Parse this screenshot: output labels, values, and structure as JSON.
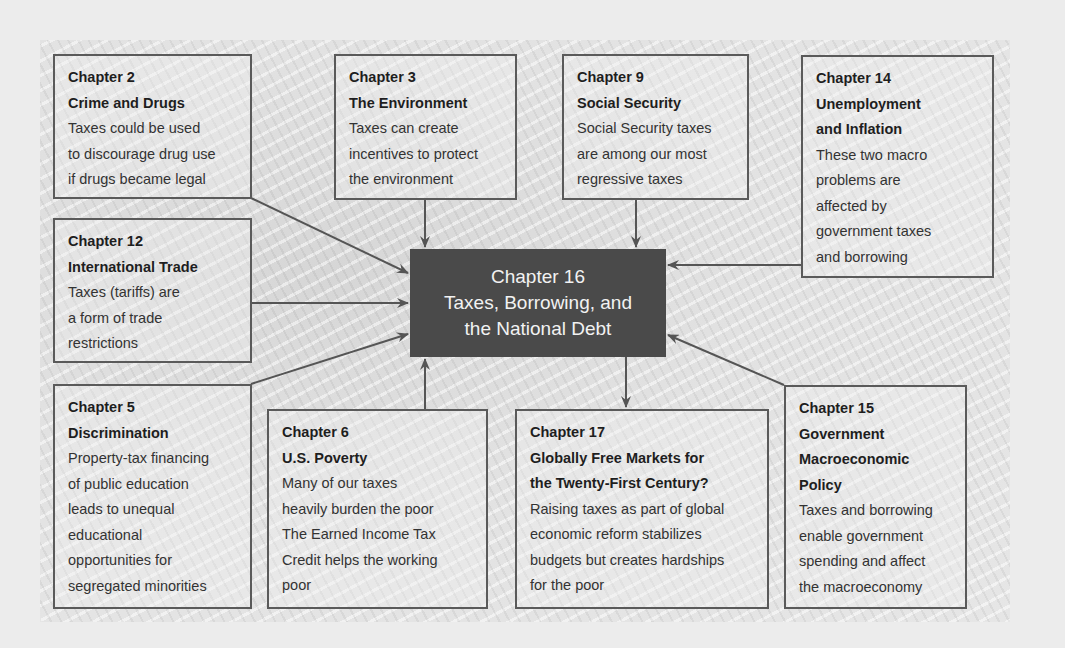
{
  "center": {
    "lines": [
      "Chapter 16",
      "Taxes, Borrowing, and",
      "the National Debt"
    ]
  },
  "boxes": [
    {
      "id": "ch2",
      "chapter": "Chapter 2",
      "title_lines": [
        "Crime and Drugs"
      ],
      "desc_lines": [
        "Taxes could be used",
        "to discourage drug use",
        "if drugs became legal"
      ]
    },
    {
      "id": "ch3",
      "chapter": "Chapter 3",
      "title_lines": [
        "The Environment"
      ],
      "desc_lines": [
        "Taxes can create",
        "incentives to protect",
        "the environment"
      ]
    },
    {
      "id": "ch9",
      "chapter": "Chapter 9",
      "title_lines": [
        "Social Security"
      ],
      "desc_lines": [
        "Social Security taxes",
        "are among our most",
        "regressive taxes"
      ]
    },
    {
      "id": "ch14",
      "chapter": "Chapter 14",
      "title_lines": [
        "Unemployment",
        "and Inflation"
      ],
      "desc_lines": [
        "These two macro",
        "problems are",
        "affected by",
        "government taxes",
        "and borrowing"
      ]
    },
    {
      "id": "ch12",
      "chapter": "Chapter 12",
      "title_lines": [
        "International Trade"
      ],
      "desc_lines": [
        "Taxes (tariffs) are",
        "a form of trade",
        "restrictions"
      ]
    },
    {
      "id": "ch5",
      "chapter": "Chapter 5",
      "title_lines": [
        "Discrimination"
      ],
      "desc_lines": [
        "Property-tax financing",
        "of public education",
        "leads to unequal",
        "educational",
        "opportunities for",
        "segregated minorities"
      ]
    },
    {
      "id": "ch6",
      "chapter": "Chapter 6",
      "title_lines": [
        "U.S. Poverty"
      ],
      "desc_lines": [
        "Many of our taxes",
        "heavily burden the poor",
        "The Earned Income Tax",
        "Credit helps the working",
        "poor"
      ]
    },
    {
      "id": "ch17",
      "chapter": "Chapter 17",
      "title_lines": [
        "Globally Free Markets for",
        "the Twenty-First Century?"
      ],
      "desc_lines": [
        "Raising taxes as part of global",
        "economic reform stabilizes",
        "budgets but creates hardships",
        "for the poor"
      ]
    },
    {
      "id": "ch15",
      "chapter": "Chapter 15",
      "title_lines": [
        "Government",
        "Macroeconomic",
        "Policy"
      ],
      "desc_lines": [
        "Taxes and borrowing",
        "enable government",
        "spending and affect",
        "the macroeconomy"
      ]
    }
  ],
  "colors": {
    "center_bg": "#4a4a4a",
    "border": "#5a5a5a",
    "arrow": "#555555"
  }
}
